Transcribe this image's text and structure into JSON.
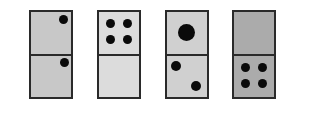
{
  "colors": {
    "border": "#2a2a2a",
    "pip": "#0a0a0a",
    "background": "#ffffff"
  },
  "dominoes": [
    {
      "index": 1,
      "left": 29,
      "fill": "#c8c8c8",
      "top_pips": [
        {
          "x": 34,
          "y": 9,
          "r": 4.5
        }
      ],
      "bottom_pips": [
        {
          "x": 35,
          "y": 8,
          "r": 4.5
        }
      ],
      "top_value": 1,
      "bottom_value": 1
    },
    {
      "index": 2,
      "left": 97,
      "fill": "#dcdcdc",
      "top_pips": [
        {
          "x": 13,
          "y": 13,
          "r": 4.5
        },
        {
          "x": 30,
          "y": 13,
          "r": 4.5
        },
        {
          "x": 13,
          "y": 29,
          "r": 4.5
        },
        {
          "x": 30,
          "y": 29,
          "r": 4.5
        }
      ],
      "bottom_pips": [],
      "top_value": 4,
      "bottom_value": 0
    },
    {
      "index": 3,
      "left": 165,
      "fill": "#d0d0d0",
      "top_pips": [
        {
          "x": 21,
          "y": 22,
          "r": 8.5
        }
      ],
      "bottom_pips": [
        {
          "x": 11,
          "y": 12,
          "r": 5
        },
        {
          "x": 31,
          "y": 32,
          "r": 5
        }
      ],
      "top_value": 1,
      "bottom_value": 2
    },
    {
      "index": 4,
      "left": 232,
      "fill": "#ababab",
      "top_pips": [],
      "bottom_pips": [
        {
          "x": 13,
          "y": 13,
          "r": 4.5
        },
        {
          "x": 30,
          "y": 13,
          "r": 4.5
        },
        {
          "x": 13,
          "y": 29,
          "r": 4.5
        },
        {
          "x": 30,
          "y": 29,
          "r": 4.5
        }
      ],
      "top_value": 0,
      "bottom_value": 4
    }
  ]
}
